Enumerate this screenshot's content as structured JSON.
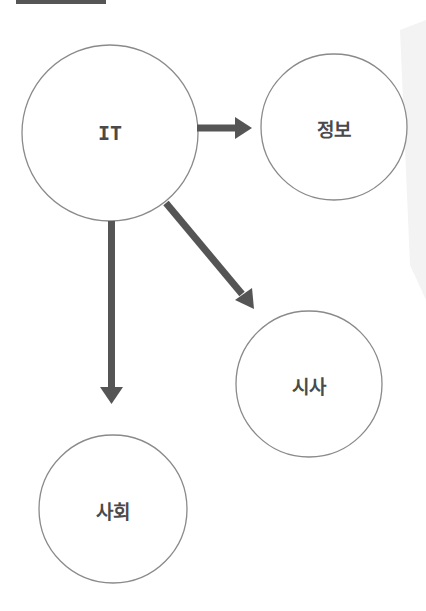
{
  "colors": {
    "arrow": "#555555",
    "circle_stroke": "#8a8a8a",
    "label": "#4a4a4a",
    "top_bar": "#555555",
    "fold_shadow": "#f3f3f3"
  },
  "diagram": {
    "nodes": [
      {
        "id": "it",
        "label": "IT",
        "cx": 110,
        "cy": 133,
        "r": 88
      },
      {
        "id": "info",
        "label": "정보",
        "cx": 334,
        "cy": 127,
        "r": 73
      },
      {
        "id": "current-affairs",
        "label": "시사",
        "cx": 309,
        "cy": 384,
        "r": 73
      },
      {
        "id": "society",
        "label": "사회",
        "cx": 113,
        "cy": 509,
        "r": 74
      }
    ],
    "edges": [
      {
        "from": "it",
        "to": "info",
        "direction": "right"
      },
      {
        "from": "it",
        "to": "current-affairs",
        "direction": "down-right"
      },
      {
        "from": "it",
        "to": "society",
        "direction": "down"
      }
    ]
  }
}
